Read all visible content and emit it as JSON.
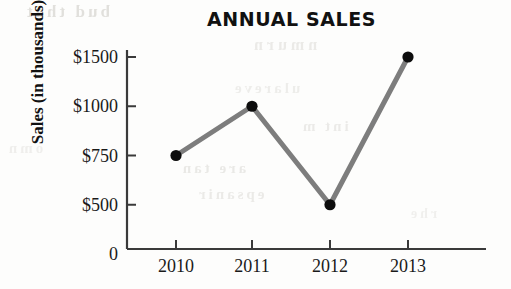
{
  "chart_data": {
    "type": "line",
    "title": "ANNUAL SALES",
    "xlabel": "",
    "ylabel": "Sales (in thousands)",
    "categories": [
      "2010",
      "2011",
      "2012",
      "2013"
    ],
    "values": [
      750,
      1000,
      500,
      1500
    ],
    "value_labels": [
      "$750",
      "$1000",
      "$500",
      "$1500"
    ],
    "y_tick_labels": [
      "$1500",
      "$1000",
      "$750",
      "$500",
      "0"
    ],
    "y_tick_values": [
      1500,
      1000,
      750,
      500,
      0
    ],
    "y_axis_note": "tick marks are evenly spaced although the value intervals are unequal",
    "grid": false,
    "legend": false,
    "line_color": "#7d7d7d",
    "marker_color": "#0d0d0d",
    "axis_color": "#3a3a3a"
  },
  "ghost_text": {
    "g1": "bud  that",
    "g2": "nmurn",
    "g3": "ulareve",
    "g4": "int m",
    "g5": "are tan",
    "g6": "epsanir",
    "g7": "omn",
    "g8": "rhe"
  }
}
